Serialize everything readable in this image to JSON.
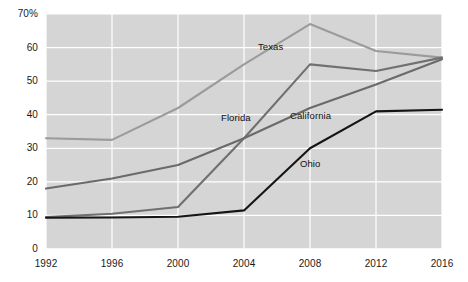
{
  "chart_data": {
    "type": "line",
    "title": "",
    "xlabel": "",
    "ylabel": "",
    "categories": [
      "1992",
      "1996",
      "2000",
      "2004",
      "2008",
      "2012",
      "2016"
    ],
    "x": [
      1992,
      1996,
      2000,
      2004,
      2008,
      2012,
      2016
    ],
    "xlim": [
      1992,
      2016
    ],
    "ylim": [
      0,
      70
    ],
    "y_ticks": [
      0,
      10,
      20,
      30,
      40,
      50,
      60,
      70
    ],
    "y_tick_labels": [
      "0",
      "10",
      "20",
      "30",
      "40",
      "50",
      "60",
      "70%"
    ],
    "grid": true,
    "legend_position": "inline-labels",
    "series": [
      {
        "name": "Texas",
        "color": "#9b9b9b",
        "values": [
          33,
          32.5,
          42,
          55,
          67,
          59,
          57
        ]
      },
      {
        "name": "Florida",
        "color": "#707070",
        "values": [
          9.5,
          10.5,
          12.5,
          33,
          55,
          53,
          57
        ]
      },
      {
        "name": "California",
        "color": "#6a6a6a",
        "values": [
          18,
          21,
          25,
          33,
          42,
          49,
          56.5
        ]
      },
      {
        "name": "Ohio",
        "color": "#151515",
        "values": [
          9.3,
          9.4,
          9.6,
          11.5,
          30,
          41,
          41.5
        ]
      }
    ],
    "annotations": [
      {
        "text": "Texas",
        "series": "Texas",
        "x": 258,
        "y": 41
      },
      {
        "text": "Florida",
        "series": "Florida",
        "x": 221,
        "y": 112
      },
      {
        "text": "California",
        "series": "California",
        "x": 290,
        "y": 110
      },
      {
        "text": "Ohio",
        "series": "Ohio",
        "x": 300,
        "y": 158
      }
    ],
    "style": {
      "plot_background": "#d5d5d5",
      "grid_color": "#ffffff",
      "page_background": "#ffffff",
      "tick_label_color": "#1a1a1a"
    }
  }
}
